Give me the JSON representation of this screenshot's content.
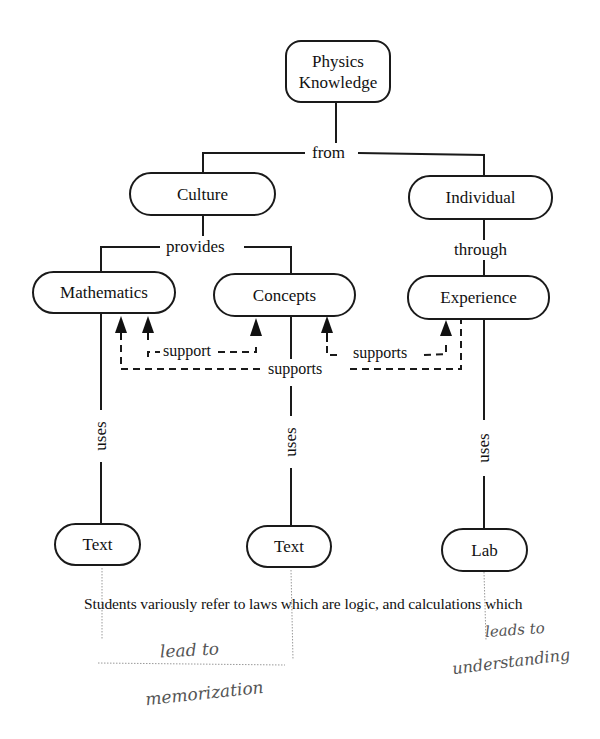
{
  "diagram": {
    "type": "concept-map",
    "nodes": {
      "root": {
        "label_line1": "Physics",
        "label_line2": "Knowledge"
      },
      "culture": {
        "label": "Culture"
      },
      "individual": {
        "label": "Individual"
      },
      "mathematics": {
        "label": "Mathematics"
      },
      "concepts": {
        "label": "Concepts"
      },
      "experience": {
        "label": "Experience"
      },
      "text1": {
        "label": "Text"
      },
      "text2": {
        "label": "Text"
      },
      "lab": {
        "label": "Lab"
      }
    },
    "edge_labels": {
      "from": "from",
      "provides": "provides",
      "through": "through",
      "support": "support",
      "supports_right": "supports",
      "supports_bottom": "supports",
      "uses1": "uses",
      "uses2": "uses",
      "uses3": "uses"
    },
    "edges": [
      {
        "from": "Physics Knowledge",
        "to": "Culture",
        "label": "from"
      },
      {
        "from": "Physics Knowledge",
        "to": "Individual",
        "label": "from"
      },
      {
        "from": "Culture",
        "to": "Mathematics",
        "label": "provides"
      },
      {
        "from": "Culture",
        "to": "Concepts",
        "label": "provides"
      },
      {
        "from": "Individual",
        "to": "Experience",
        "label": "through"
      },
      {
        "from": "Concepts",
        "to": "Mathematics",
        "label": "support",
        "style": "dashed-arrow"
      },
      {
        "from": "Mathematics",
        "to": "Concepts",
        "label": "support",
        "style": "dashed-arrow"
      },
      {
        "from": "Experience",
        "to": "Concepts",
        "label": "supports",
        "style": "dashed-arrow"
      },
      {
        "from": "Concepts",
        "to": "Experience",
        "label": "supports",
        "style": "dashed-arrow"
      },
      {
        "from": "Experience",
        "to": "Mathematics",
        "label": "supports",
        "style": "dashed-arrow"
      },
      {
        "from": "Mathematics",
        "to": "Text",
        "label": "uses"
      },
      {
        "from": "Concepts",
        "to": "Text",
        "label": "uses"
      },
      {
        "from": "Experience",
        "to": "Lab",
        "label": "uses"
      }
    ]
  },
  "caption": "Students variously refer to laws which are logic, and calculations which",
  "annotations": {
    "left_line1": "lead to",
    "left_line2": "memorization",
    "right_line1": "leads to",
    "right_line2": "understanding"
  },
  "colors": {
    "ink": "#1a1a1a",
    "pencil": "#888888",
    "background": "#ffffff"
  }
}
